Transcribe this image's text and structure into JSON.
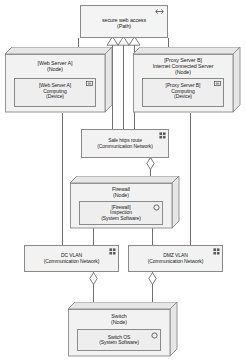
{
  "diagram": {
    "type": "UML Deployment Diagram"
  },
  "nodes": {
    "path": {
      "label": "secure web access\n(Path)",
      "icon": "path-link-icon"
    },
    "web_server_node": {
      "label": "[Web Server A]\n(Node)",
      "device": {
        "label": "[Web Server A]\nComputing\n(Device)",
        "icon": "device-icon"
      }
    },
    "proxy_server_node": {
      "label": "[Proxy Server B]\nInternet Connected Server\n(Node)",
      "device": {
        "label": "[Proxy Server B]\nComputing\n(Device)",
        "icon": "device-icon"
      }
    },
    "https_route": {
      "label": "Safe https route\n(Communication Network)",
      "icon": "network-icon"
    },
    "firewall_node": {
      "label": "Firewall\n(Node)",
      "software": {
        "label": "[Firewall]\nInspection\n(System Software)",
        "icon": "system-software-icon"
      }
    },
    "dc_vlan": {
      "label": "DC VLAN\n(Communication Network)",
      "icon": "network-icon"
    },
    "dmz_vlan": {
      "label": "DMZ VLAN\n(Communication Network)",
      "icon": "network-icon"
    },
    "switch_node": {
      "label": "Switch\n(Node)",
      "software": {
        "label": "Switch OS\n(System Software)",
        "icon": "system-software-icon"
      }
    }
  },
  "connectors": {
    "generalization_count": 3,
    "generalization_marker": "hollow-triangle",
    "aggregation_marker": "hollow-diamond",
    "aggregation_count": 3
  },
  "colors": {
    "stroke": "#8a8a8a",
    "line": "#6f6f6f",
    "fill": "#f2f2f2",
    "fill_inner": "#eeeeee",
    "fill_shade": "#e6e6e6",
    "text": "#1c1c1c",
    "background": "#ffffff"
  }
}
